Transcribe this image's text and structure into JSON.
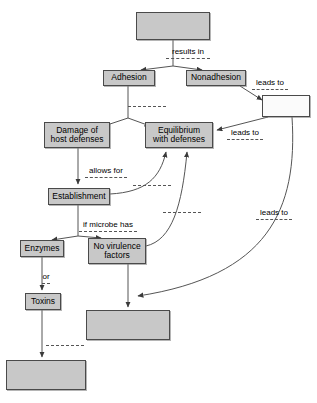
{
  "diagram": {
    "background_color": "#ffffff",
    "node_fill": "#c8c8c8",
    "node_border": "#4a4a4a",
    "nodes": [
      {
        "id": "top",
        "label": "",
        "filled": true,
        "x": 136,
        "y": 12,
        "w": 74,
        "h": 28
      },
      {
        "id": "adhesion",
        "label": "Adhesion",
        "filled": true,
        "x": 103,
        "y": 70,
        "w": 52,
        "h": 16
      },
      {
        "id": "nonadhesion",
        "label": "Nonadhesion",
        "filled": true,
        "x": 186,
        "y": 70,
        "w": 60,
        "h": 16
      },
      {
        "id": "rightblank",
        "label": "",
        "filled": false,
        "x": 262,
        "y": 95,
        "w": 48,
        "h": 22
      },
      {
        "id": "damage",
        "label": "Damage of\nhost defenses",
        "filled": true,
        "x": 44,
        "y": 122,
        "w": 66,
        "h": 26
      },
      {
        "id": "equilibrium",
        "label": "Equilibrium\nwith defenses",
        "filled": true,
        "x": 145,
        "y": 122,
        "w": 68,
        "h": 26
      },
      {
        "id": "establishment",
        "label": "Establishment",
        "filled": true,
        "x": 48,
        "y": 188,
        "w": 62,
        "h": 17
      },
      {
        "id": "enzymes",
        "label": "Enzymes",
        "filled": true,
        "x": 20,
        "y": 240,
        "w": 44,
        "h": 17
      },
      {
        "id": "novirulence",
        "label": "No virulence\nfactors",
        "filled": true,
        "x": 88,
        "y": 238,
        "w": 58,
        "h": 26
      },
      {
        "id": "toxins",
        "label": "Toxins",
        "filled": true,
        "x": 25,
        "y": 293,
        "w": 36,
        "h": 17
      },
      {
        "id": "bottomright",
        "label": "",
        "filled": true,
        "x": 86,
        "y": 310,
        "w": 84,
        "h": 30
      },
      {
        "id": "bottomleft",
        "label": "",
        "filled": true,
        "x": 6,
        "y": 360,
        "w": 80,
        "h": 30
      }
    ],
    "edge_labels": [
      {
        "id": "results-in",
        "text": "results in",
        "x": 163,
        "y": 47,
        "w": 50
      },
      {
        "id": "leads-to-top",
        "text": "leads to",
        "x": 249,
        "y": 78,
        "w": 42
      },
      {
        "id": "leads-to-mid",
        "text": "leads to",
        "x": 224,
        "y": 128,
        "w": 42
      },
      {
        "id": "allows-for",
        "text": "allows for",
        "x": 82,
        "y": 166,
        "w": 48
      },
      {
        "id": "if-microbe-has",
        "text": "if microbe has",
        "x": 76,
        "y": 220,
        "w": 64
      },
      {
        "id": "or",
        "text": "or",
        "x": 39,
        "y": 272,
        "w": 14
      },
      {
        "id": "leads-to-right",
        "text": "leads to",
        "x": 253,
        "y": 208,
        "w": 42
      }
    ],
    "blank_dashes": [
      {
        "id": "dash-adhesion-branch",
        "x": 128,
        "y": 106,
        "w": 38
      },
      {
        "id": "dash-establishment",
        "x": 133,
        "y": 185,
        "w": 38
      },
      {
        "id": "dash-middle-curve",
        "x": 163,
        "y": 212,
        "w": 38
      },
      {
        "id": "dash-toxins-bottom",
        "x": 46,
        "y": 345,
        "w": 38
      }
    ]
  }
}
